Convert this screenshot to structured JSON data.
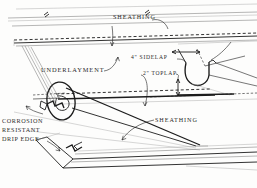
{
  "figure": {
    "kind": "roofing-underlayment-installation-detail",
    "background_color": "#fdfdfc",
    "ink_color": "#1c1c1c",
    "light_ink_color": "#8d8d8d"
  },
  "labels": {
    "sheathing_top": "SHEATHING",
    "underlayment": "UNDERLAYMENT",
    "sidelap": "4\"  SIDELAP",
    "toplap": "2\"  TOPLAP",
    "sheathing_lower": "SHEATHING",
    "drip_edge_line1": "CORROSION",
    "drip_edge_line2": "RESISTANT",
    "drip_edge_line3": "DRIP EDGE"
  },
  "callouts": [
    {
      "name": "sheathing-top-leader",
      "target": "upper roof deck boards"
    },
    {
      "name": "underlayment-leader",
      "target": "felt underlayment sheet"
    },
    {
      "name": "sidelap-dimension",
      "value": "4\"",
      "unit": "inches"
    },
    {
      "name": "toplap-dimension",
      "value": "2\"",
      "unit": "inches"
    },
    {
      "name": "sheathing-lower-leader",
      "target": "lower roof deck"
    },
    {
      "name": "drip-edge-leader",
      "target": "corrosion resistant drip edge"
    }
  ],
  "components": [
    {
      "name": "roof-sheathing-deck",
      "description": "sloped plywood deck planes"
    },
    {
      "name": "underlayment-roll",
      "description": "partially unrolled felt roll at left"
    },
    {
      "name": "underlayment-curl-right",
      "description": "curled free edge of felt at right showing sidelap"
    },
    {
      "name": "drip-edge-profile",
      "description": "bent metal drip edge along eave at bottom"
    }
  ]
}
